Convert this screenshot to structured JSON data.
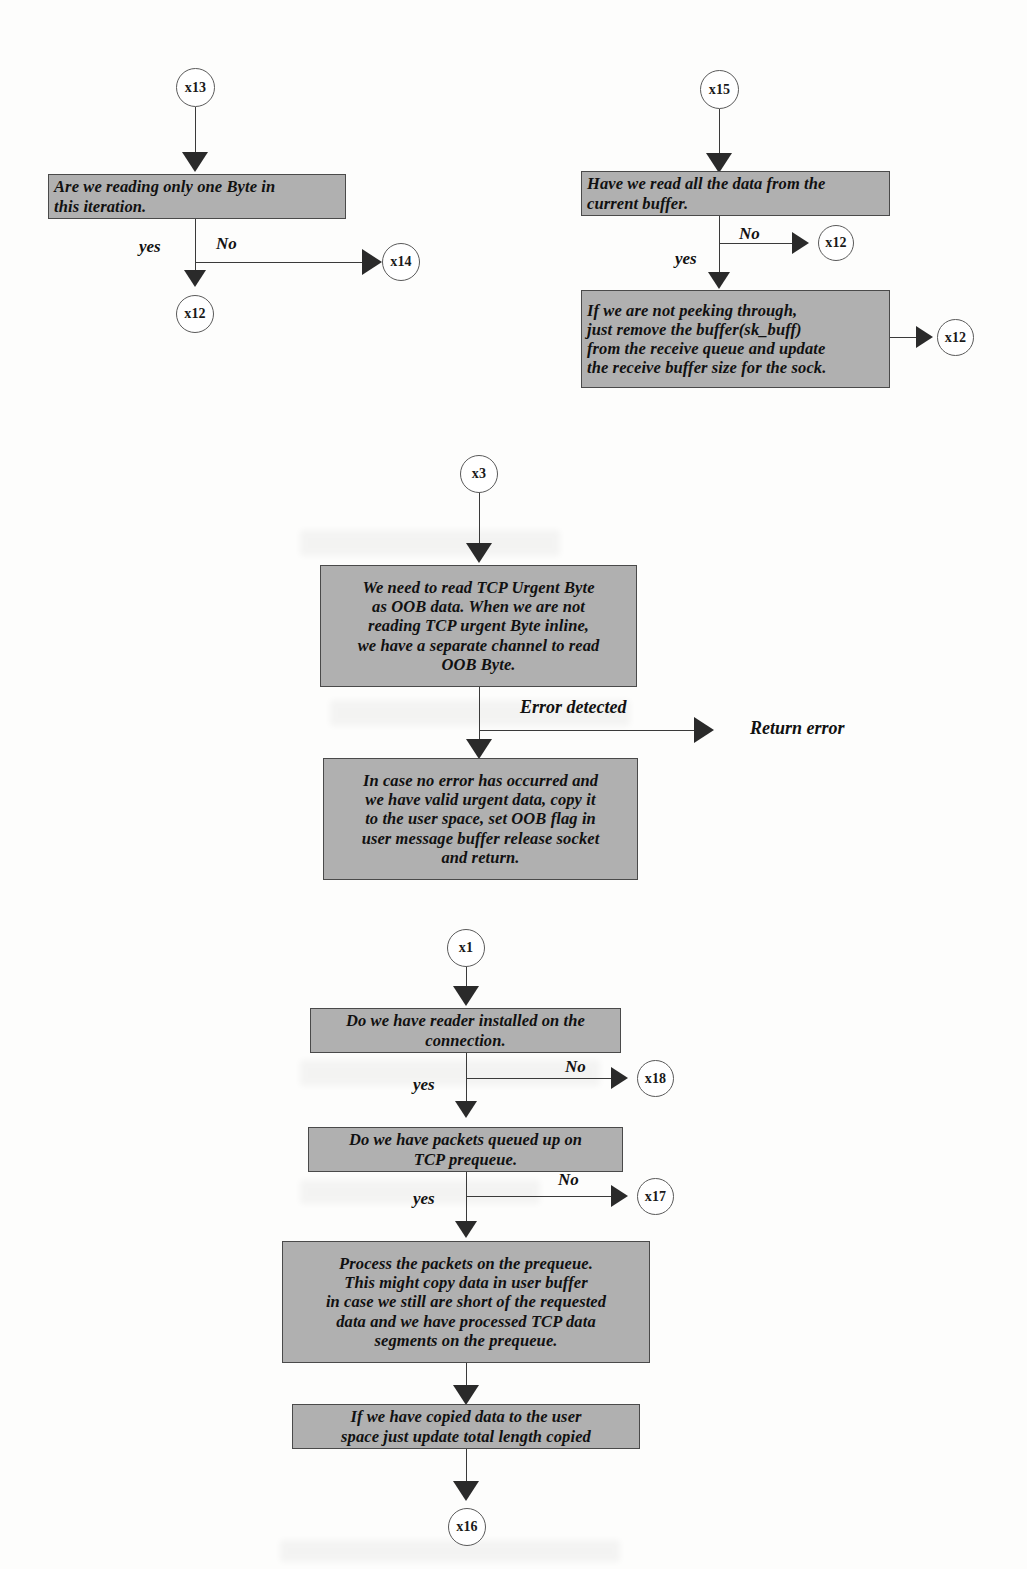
{
  "diagram": {
    "colors": {
      "box_fill": "#b0b0b0",
      "box_border": "#4a4a4a",
      "line": "#3a3a3a",
      "arrow": "#2a2a2a",
      "page": "#fdfdfc"
    },
    "groups": [
      {
        "id": "group-x13",
        "entry_node": "x13",
        "boxes": [
          {
            "id": "box-one-byte",
            "lines": [
              "Are we reading only one Byte in",
              "this iteration."
            ]
          }
        ],
        "edge_labels": [
          "yes",
          "No"
        ],
        "exit_nodes": [
          "x14",
          "x12"
        ]
      },
      {
        "id": "group-x15",
        "entry_node": "x15",
        "boxes": [
          {
            "id": "box-read-all-data",
            "lines": [
              "Have we read all the data from the",
              "current buffer."
            ]
          },
          {
            "id": "box-not-peeking",
            "lines": [
              "If we are not peeking through,",
              "just remove the buffer(sk_buff)",
              " from the receive queue and update",
              "the receive buffer size for the sock."
            ]
          }
        ],
        "edge_labels": [
          "No",
          "yes"
        ],
        "exit_nodes": [
          "x12",
          "x12"
        ]
      },
      {
        "id": "group-x3",
        "entry_node": "x3",
        "boxes": [
          {
            "id": "box-urgent-byte",
            "lines": [
              "We need to read TCP Urgent Byte",
              "as OOB data. When we are not",
              "reading TCP urgent Byte inline,",
              "we have a separate channel to read",
              "OOB Byte."
            ]
          },
          {
            "id": "box-no-error",
            "lines": [
              "In case no error has occurred and",
              "we have valid urgent data, copy it",
              "to the user space, set OOB flag in",
              "user message buffer release socket",
              "and return."
            ]
          }
        ],
        "edge_labels": [
          "Error detected"
        ],
        "terminal_text": "Return error"
      },
      {
        "id": "group-x1",
        "entry_node": "x1",
        "boxes": [
          {
            "id": "box-reader-installed",
            "lines": [
              "Do we have reader installed on the",
              "connection."
            ]
          },
          {
            "id": "box-packets-queued",
            "lines": [
              "Do we have packets queued up on",
              "TCP prequeue."
            ]
          },
          {
            "id": "box-process-prequeue",
            "lines": [
              "Process the packets on the prequeue.",
              "This might copy data in user buffer",
              "in case we still are short of the requested",
              "data and we have processed TCP data",
              "segments on the prequeue."
            ]
          },
          {
            "id": "box-copied-data",
            "lines": [
              "If we have copied data to the user",
              "space just update total  length copied"
            ]
          }
        ],
        "edge_labels": [
          "No",
          "yes",
          "No",
          "yes"
        ],
        "exit_nodes": [
          "x18",
          "x17",
          "x16"
        ]
      }
    ],
    "nodes": {
      "x13": "x13",
      "x14": "x14",
      "x12_a": "x12",
      "x15": "x15",
      "x12_b": "x12",
      "x12_c": "x12",
      "x3": "x3",
      "x1": "x1",
      "x18": "x18",
      "x17": "x17",
      "x16": "x16"
    },
    "boxes": {
      "one_byte": "Are we reading only one Byte in\nthis iteration.",
      "read_all_data": "Have we read all the data from the\ncurrent buffer.",
      "not_peeking": "If we are not peeking through,\njust remove the buffer(sk_buff)\n from the receive queue and update\nthe receive buffer size for the sock.",
      "urgent_byte": "We need to read TCP Urgent Byte\nas OOB data. When we are not\nreading TCP urgent Byte inline,\nwe have a separate channel to read\nOOB Byte.",
      "no_error": "In case no error has occurred and\nwe have valid urgent data, copy it\nto the user space, set OOB flag in\nuser message buffer release socket\nand return.",
      "reader_installed": "Do we have reader installed on the\nconnection.",
      "packets_queued": "Do we have packets queued up on\nTCP prequeue.",
      "process_prequeue": "Process the packets on the prequeue.\nThis might copy data in user buffer\nin case we still are short of the requested\ndata and we have processed TCP data\nsegments on the prequeue.",
      "copied_data": "If we have copied data to the user\nspace just update total  length copied"
    },
    "labels": {
      "yes_1": "yes",
      "no_1": "No",
      "no_2": "No",
      "yes_2": "yes",
      "error_detected": "Error detected",
      "return_error": "Return error",
      "no_3": "No",
      "yes_3": "yes",
      "no_4": "No",
      "yes_4": "yes"
    }
  }
}
